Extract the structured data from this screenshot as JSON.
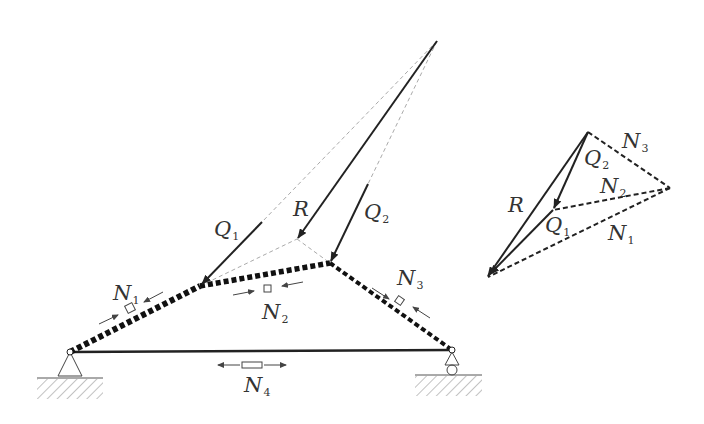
{
  "diagram": {
    "type": "three-hinged truss / funicular force diagram",
    "structure": {
      "nodes": {
        "left_support": [
          70,
          352
        ],
        "Q1_node": [
          200,
          286
        ],
        "Q2_node": [
          330,
          263
        ],
        "right_support": [
          452,
          350
        ],
        "apex": [
          437,
          41
        ],
        "R_tip": [
          297,
          239
        ]
      },
      "members": [
        {
          "id": "N1",
          "from": "left_support",
          "to": "Q1_node",
          "style": "compression-dashed-thick"
        },
        {
          "id": "N2",
          "from": "Q1_node",
          "to": "Q2_node",
          "style": "compression-dashed-thick"
        },
        {
          "id": "N3",
          "from": "Q2_node",
          "to": "right_support",
          "style": "compression-dashed"
        },
        {
          "id": "N4",
          "from": "left_support",
          "to": "right_support",
          "style": "tension-solid"
        }
      ],
      "loads": [
        {
          "id": "Q1",
          "label": "Q",
          "sub": "1"
        },
        {
          "id": "Q2",
          "label": "Q",
          "sub": "2"
        },
        {
          "id": "R",
          "label": "R",
          "sub": ""
        }
      ],
      "member_labels": [
        {
          "id": "N1",
          "label": "N",
          "sub": "1"
        },
        {
          "id": "N2",
          "label": "N",
          "sub": "2"
        },
        {
          "id": "N3",
          "label": "N",
          "sub": "3"
        },
        {
          "id": "N4",
          "label": "N",
          "sub": "4"
        }
      ]
    },
    "force_polygon": {
      "points": {
        "top": [
          588,
          132
        ],
        "right": [
          670,
          188
        ],
        "mid": [
          553,
          210
        ],
        "bottom": [
          487,
          277
        ]
      },
      "labels": [
        {
          "id": "R",
          "label": "R",
          "sub": ""
        },
        {
          "id": "Q2",
          "label": "Q",
          "sub": "2"
        },
        {
          "id": "Q1",
          "label": "Q",
          "sub": "1"
        },
        {
          "id": "N3",
          "label": "N",
          "sub": "3"
        },
        {
          "id": "N2",
          "label": "N",
          "sub": "2"
        },
        {
          "id": "N1",
          "label": "N",
          "sub": "1"
        }
      ]
    },
    "colors": {
      "line": "#222222",
      "thin_dashed": "#aaaaaa",
      "hatch": "#999999"
    }
  }
}
